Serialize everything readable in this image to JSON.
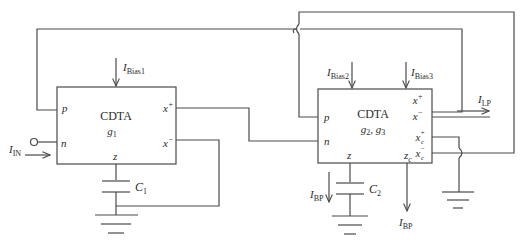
{
  "blocks": [
    {
      "name": "CDTA",
      "gain_label": "g",
      "gain_sub": "1",
      "ports": {
        "p": "p",
        "n": "n",
        "z": "z",
        "xp": "x",
        "xm": "x"
      },
      "bias": {
        "main": "I",
        "sub": "Bias1"
      }
    },
    {
      "name": "CDTA",
      "gain_label": "g",
      "gain_sub_a": "2",
      "gain_sub_b": "3",
      "ports": {
        "p": "p",
        "n": "n",
        "z": "z",
        "zc": "z",
        "zc_sub": "c",
        "xp": "x",
        "xm": "x",
        "xcp": "x",
        "xcm": "x",
        "c_sub": "c"
      },
      "bias2": {
        "main": "I",
        "sub": "Bias2"
      },
      "bias3": {
        "main": "I",
        "sub": "Bias3"
      }
    }
  ],
  "signals": {
    "input": {
      "main": "I",
      "sub": "IN"
    },
    "lowpass": {
      "main": "I",
      "sub": "LP"
    },
    "bandpass_1": {
      "main": "I",
      "sub": "BP"
    },
    "bandpass_2": {
      "main": "I",
      "sub": "BP"
    }
  },
  "capacitors": [
    {
      "main": "C",
      "sub": "1"
    },
    {
      "main": "C",
      "sub": "2"
    }
  ],
  "symbols": {
    "plus": "+",
    "minus": "−",
    "comma": ", "
  }
}
